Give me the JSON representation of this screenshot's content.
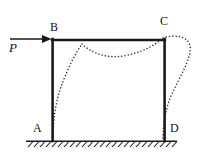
{
  "figure": {
    "kind": "structural-frame-deflected-shape",
    "width": 199,
    "height": 158,
    "background_color": "#ffffff",
    "member_color": "#1a1a1a",
    "deflection_color": "#333333",
    "ground_color": "#1a1a1a",
    "labels": {
      "node_a": "A",
      "node_b": "B",
      "node_c": "C",
      "node_d": "D",
      "load": "P"
    },
    "geometry": {
      "left_column": {
        "top": "B",
        "bottom": "A",
        "x": 52,
        "y_top": 40,
        "y_bottom": 140
      },
      "right_column": {
        "top": "C",
        "bottom": "D",
        "x": 165,
        "y_top": 40,
        "y_bottom": 140
      },
      "top_beam": {
        "left": "B",
        "right": "C",
        "y": 40,
        "x_left": 52,
        "x_right": 165
      },
      "ground_line": {
        "y": 141,
        "x_start": 26,
        "x_end": 177
      }
    },
    "load": {
      "symbol": "P",
      "direction": "right",
      "applied_at": "B",
      "arrow_tail_x": 10,
      "arrow_head_x": 52,
      "arrow_y": 39
    },
    "supports": {
      "a": "fixed",
      "d": "fixed",
      "hatch_count": 25
    },
    "deflected_shape": {
      "style": "dotted",
      "description": "sway deflection of portal frame under horizontal load P at B"
    }
  }
}
